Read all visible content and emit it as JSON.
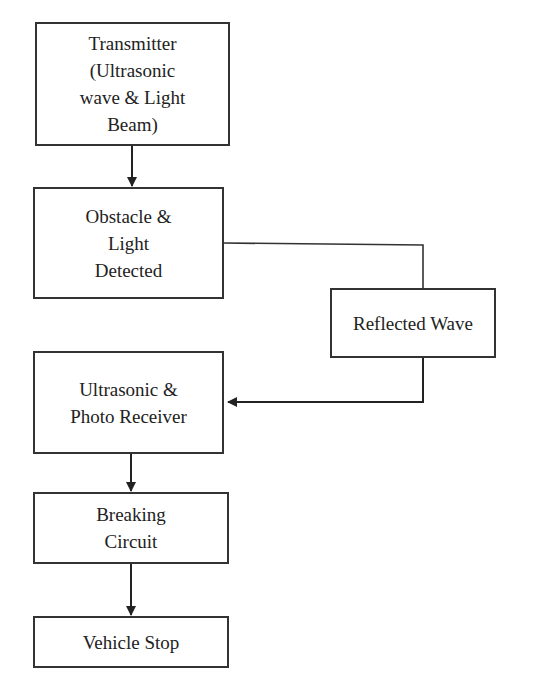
{
  "diagram": {
    "type": "flowchart",
    "nodes": [
      {
        "id": "transmitter",
        "label": "Transmitter\n(Ultrasonic\nwave & Light\nBeam)"
      },
      {
        "id": "obstacle",
        "label": "Obstacle &\nLight\nDetected"
      },
      {
        "id": "reflected",
        "label": "Reflected Wave"
      },
      {
        "id": "receiver",
        "label": "Ultrasonic &\nPhoto Receiver"
      },
      {
        "id": "breaking",
        "label": "Breaking\nCircuit"
      },
      {
        "id": "stop",
        "label": "Vehicle Stop"
      }
    ],
    "edges": [
      {
        "from": "transmitter",
        "to": "obstacle"
      },
      {
        "from": "obstacle",
        "to": "reflected"
      },
      {
        "from": "reflected",
        "to": "receiver"
      },
      {
        "from": "receiver",
        "to": "breaking"
      },
      {
        "from": "breaking",
        "to": "stop"
      }
    ]
  }
}
